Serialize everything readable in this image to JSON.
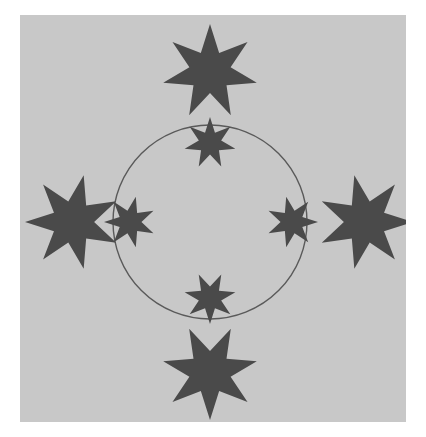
{
  "page": {
    "title": "The Perfect Circle",
    "background_color": "#ffffff"
  },
  "panel": {
    "name": "illustration-panel",
    "background_color": "#c8c8c8",
    "x": 20,
    "y": 15,
    "width": 386,
    "height": 407
  },
  "figure": {
    "star_color": "#4a4a4a",
    "circle_stroke_color": "#5a5a5a",
    "circle_stroke_width": 1.4,
    "circle": {
      "center_x": 190,
      "center_y": 207,
      "radius": 97
    },
    "inner_stars": [
      {
        "label": "inner-star-top",
        "cx": 190,
        "cy": 128,
        "radius": 26,
        "points": 7,
        "rotation": 0
      },
      {
        "label": "inner-star-right",
        "cx": 272,
        "cy": 207,
        "radius": 26,
        "points": 7,
        "rotation": 90
      },
      {
        "label": "inner-star-bottom",
        "cx": 190,
        "cy": 283,
        "radius": 26,
        "points": 7,
        "rotation": 180
      },
      {
        "label": "inner-star-left",
        "cx": 110,
        "cy": 207,
        "radius": 26,
        "points": 7,
        "rotation": 270
      }
    ],
    "outer_stars": [
      {
        "label": "outer-star-top",
        "cx": 190,
        "cy": 57,
        "radius": 48,
        "points": 7,
        "rotation": 0
      },
      {
        "label": "outer-star-right",
        "cx": 345,
        "cy": 207,
        "radius": 48,
        "points": 7,
        "rotation": 90
      },
      {
        "label": "outer-star-bottom",
        "cx": 190,
        "cy": 357,
        "radius": 48,
        "points": 7,
        "rotation": 180
      },
      {
        "label": "outer-star-left",
        "cx": 53,
        "cy": 207,
        "radius": 48,
        "points": 7,
        "rotation": 270
      }
    ]
  }
}
